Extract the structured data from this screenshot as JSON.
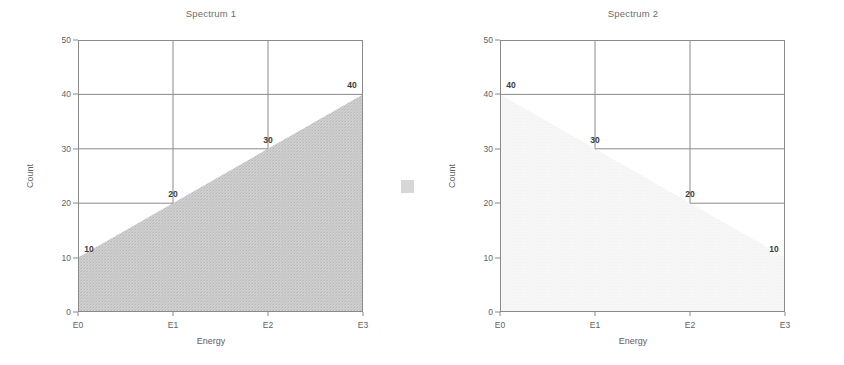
{
  "figure": {
    "divider_marker": "gray-square-artifact"
  },
  "chart_data": [
    {
      "type": "area",
      "title": "Spectrum 1",
      "xlabel": "Energy",
      "ylabel": "Count",
      "categories": [
        "E0",
        "E1",
        "E2",
        "E3"
      ],
      "x": [
        0,
        1,
        2,
        3
      ],
      "values": [
        10,
        20,
        30,
        40
      ],
      "xlim": [
        0,
        3
      ],
      "ylim": [
        0,
        50
      ],
      "yticks": [
        0,
        10,
        20,
        30,
        40,
        50
      ],
      "grid": true,
      "legend": "none",
      "fill_color": "#b0b0b0",
      "line_color": "#8a8a8a",
      "annotations": [
        {
          "label": "10",
          "x": 0,
          "y": 10
        },
        {
          "label": "20",
          "x": 1,
          "y": 20
        },
        {
          "label": "30",
          "x": 2,
          "y": 30
        },
        {
          "label": "40",
          "x": 3,
          "y": 40
        }
      ]
    },
    {
      "type": "area",
      "title": "Spectrum 2",
      "xlabel": "Energy",
      "ylabel": "Count",
      "categories": [
        "E0",
        "E1",
        "E2",
        "E3"
      ],
      "x": [
        0,
        1,
        2,
        3
      ],
      "values": [
        40,
        30,
        20,
        10
      ],
      "xlim": [
        0,
        3
      ],
      "ylim": [
        0,
        50
      ],
      "yticks": [
        0,
        10,
        20,
        30,
        40,
        50
      ],
      "grid": true,
      "legend": "none",
      "fill_color": "#f0f0f0",
      "line_color": "#8a8a8a",
      "annotations": [
        {
          "label": "40",
          "x": 0,
          "y": 40
        },
        {
          "label": "30",
          "x": 1,
          "y": 30
        },
        {
          "label": "20",
          "x": 2,
          "y": 20
        },
        {
          "label": "10",
          "x": 3,
          "y": 10
        }
      ]
    }
  ]
}
